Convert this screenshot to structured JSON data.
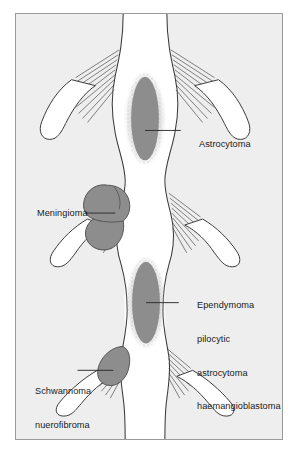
{
  "figure": {
    "type": "medical-anatomical-diagram",
    "background_color": "#eeeeee",
    "frame_border_color": "#9a9a9a",
    "page_color": "#ffffff",
    "tumour_fill_color": "#8d8d8d",
    "outline_color": "#3a3a3a",
    "text_color": "#1a1a1a"
  },
  "labels": {
    "astrocytoma": "Astrocytoma",
    "meningioma": "Meningioma",
    "ependymoma_group": [
      "Ependymoma",
      "pilocytic",
      "astrocytoma",
      "haemangioblastoma"
    ],
    "schwannoma_group": [
      "Schwannoma",
      "nuerofibroma"
    ]
  },
  "structures": {
    "spinal_cord": "spinal-cord",
    "nerve_roots": "nerve-root-fibres",
    "upper_intramedullary_tumour": "astrocytoma-mass",
    "extramedullary_intradural_tumour": "meningioma-mass",
    "lower_intramedullary_tumour": "ependymoma-mass",
    "nerve_sheath_tumour": "schwannoma-mass"
  },
  "caption": {
    "text": ""
  }
}
